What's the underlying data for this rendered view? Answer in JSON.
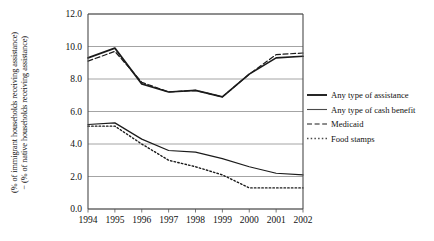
{
  "chart_data": {
    "type": "line",
    "title": "",
    "xlabel": "",
    "ylabel": "(% of immigrant households receiving assistance) − (% of native households receiving assistance)",
    "ylabel_line1": "(% of immigrant households receiving assistance)",
    "ylabel_line2": "− (% of native households receiving assistance)",
    "x": [
      1994,
      1995,
      1996,
      1997,
      1998,
      1999,
      2000,
      2001,
      2002
    ],
    "categories": [
      "1994",
      "1995",
      "1996",
      "1997",
      "1998",
      "1999",
      "2000",
      "2001",
      "2002"
    ],
    "xtick_labels": [
      "1994",
      "1995",
      "1996",
      "1997",
      "1998",
      "1999",
      "2000",
      "2001",
      "2002"
    ],
    "ytick_labels": [
      "0.0",
      "2.0",
      "4.0",
      "6.0",
      "8.0",
      "10.0",
      "12.0"
    ],
    "ytick_values": [
      0.0,
      2.0,
      4.0,
      6.0,
      8.0,
      10.0,
      12.0
    ],
    "ylim": [
      0.0,
      12.0
    ],
    "xlim": [
      1994,
      2002
    ],
    "grid": "horizontal",
    "legend_position": "right",
    "series": [
      {
        "name": "Any type of assistance",
        "style": "solid",
        "color": "#1b1b1b",
        "width": 1.7,
        "values": [
          9.3,
          9.9,
          7.7,
          7.2,
          7.3,
          6.9,
          8.3,
          9.3,
          9.4
        ]
      },
      {
        "name": "Any type of cash benefit",
        "style": "solid",
        "color": "#4a4a4a",
        "width": 1.2,
        "values": [
          5.2,
          5.3,
          4.3,
          3.6,
          3.5,
          3.1,
          2.6,
          2.2,
          2.1
        ]
      },
      {
        "name": "Medicaid",
        "style": "dashed",
        "color": "#1b1b1b",
        "width": 1.2,
        "values": [
          9.1,
          9.7,
          7.8,
          7.2,
          7.3,
          6.9,
          8.3,
          9.5,
          9.6
        ]
      },
      {
        "name": "Food stamps",
        "style": "dotted",
        "color": "#4a4a4a",
        "width": 1.4,
        "values": [
          5.1,
          5.1,
          4.0,
          3.0,
          2.6,
          2.1,
          1.3,
          1.3,
          1.3
        ]
      }
    ],
    "legend": [
      {
        "label": "Any type of assistance",
        "style": "solid",
        "color": "#1b1b1b",
        "width": 1.9
      },
      {
        "label": "Any type of cash benefit",
        "style": "solid",
        "color": "#4a4a4a",
        "width": 1.1
      },
      {
        "label": "Medicaid",
        "style": "dashed",
        "color": "#1b1b1b",
        "width": 1.1
      },
      {
        "label": "Food stamps",
        "style": "dotted",
        "color": "#4a4a4a",
        "width": 1.3
      }
    ]
  }
}
